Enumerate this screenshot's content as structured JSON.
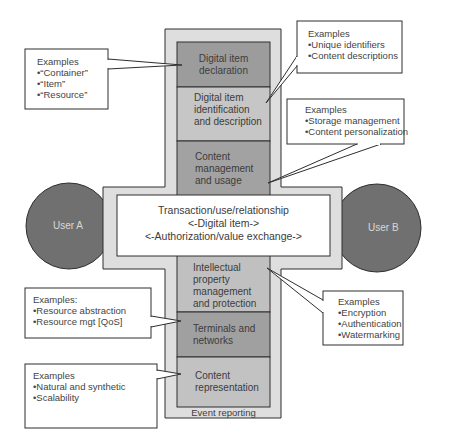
{
  "diagram": {
    "users": [
      {
        "label": "User A"
      },
      {
        "label": "User B"
      }
    ],
    "transaction": {
      "lines": [
        "Transaction/use/relationship",
        "<-Digital item->",
        "<-Authorization/value exchange->"
      ]
    },
    "blocks": [
      {
        "label_lines": [
          "Digital item",
          "declaration"
        ]
      },
      {
        "label_lines": [
          "Digital item",
          "identification",
          "and description"
        ]
      },
      {
        "label_lines": [
          "Content",
          "management",
          "and usage"
        ]
      },
      {
        "label_lines": [
          "Intellectual",
          "property",
          "management",
          "and protection"
        ]
      },
      {
        "label_lines": [
          "Terminals and",
          "networks"
        ]
      },
      {
        "label_lines": [
          "Content",
          "representation"
        ]
      }
    ],
    "footer": "Event reporting",
    "callouts": [
      {
        "title": "Examples",
        "items": [
          "•“Container”",
          "•“Item”",
          "•“Resource”"
        ]
      },
      {
        "title": "Examples",
        "items": [
          "•Unique identifiers",
          "•Content descriptions"
        ]
      },
      {
        "title": "Examples",
        "items": [
          "•Storage management",
          "•Content personalization"
        ]
      },
      {
        "title": "Examples",
        "items": [
          "•Encryption",
          "•Authentication",
          "•Watermarking"
        ]
      },
      {
        "title": "Examples:",
        "items": [
          "•Resource abstraction",
          "•Resource mgt [QoS]"
        ]
      },
      {
        "title": "Examples",
        "items": [
          "•Natural and synthetic",
          "•Scalability"
        ]
      }
    ],
    "colors": {
      "cross_fill": "#dcdcdc",
      "block_dark": "#9a9a9a",
      "block_light": "#c4c4c4",
      "block_mid": "#b0b0b0",
      "user_fill": "#6e6e6e",
      "stroke": "#2e2e2e"
    }
  }
}
